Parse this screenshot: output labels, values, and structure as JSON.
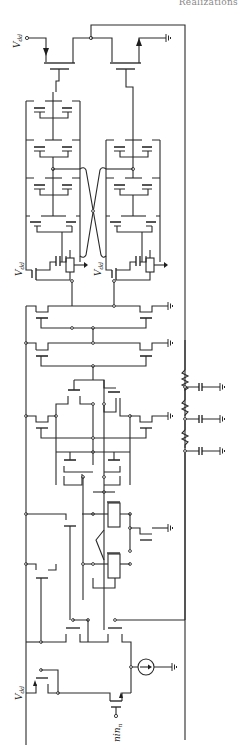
{
  "page": {
    "running_head": "Realizations"
  },
  "schematic": {
    "orientation": "rotated-90",
    "labels": {
      "vdd_top": "V",
      "vdd_top_sub": "dd",
      "vdd_latch_left": "V",
      "vdd_latch_left_sub": "dd",
      "vdd_latch_right": "V",
      "vdd_latch_right_sub": "dd",
      "vdd_bottom": "V",
      "vdd_bottom_sub": "dd",
      "input": "nin",
      "input_sub": "n"
    },
    "blocks": [
      {
        "name": "output-stage",
        "description": "complementary output transistors with Vdd and ground"
      },
      {
        "name": "cross-coupled-latch",
        "description": "two stacked transistor columns cross-coupled"
      },
      {
        "name": "differential-pair-stages",
        "description": "two differential amplifier stages with ground returns"
      },
      {
        "name": "gain-stage",
        "description": "folded cascode with current mirrors"
      },
      {
        "name": "rc-ladder",
        "description": "three series resistors with shunt capacitors to ground"
      },
      {
        "name": "input-stage",
        "description": "input transistor with current source to ground"
      }
    ],
    "colors": {
      "line": "#2a2a2a",
      "background": "#ffffff"
    }
  }
}
